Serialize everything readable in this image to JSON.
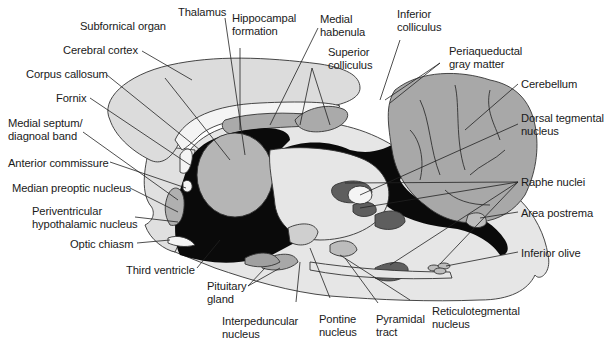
{
  "figure": {
    "colors": {
      "background": "#ffffff",
      "brain_light": "#e3e3e3",
      "cortex": "#dedede",
      "mid_gray": "#b0b0b0",
      "cerebellum": "#a6a6a6",
      "dark_nuclei": "#5e5e5e",
      "ventricle": "#0a0a0a",
      "white_matter": "#f4f4f4",
      "line": "#222222"
    },
    "labels": {
      "subfornical_organ": "Subfornical organ",
      "cerebral_cortex": "Cerebral cortex",
      "corpus_callosum": "Corpus callosum",
      "fornix": "Fornix",
      "medial_septum_1": "Medial septum/",
      "medial_septum_2": "diagnoal band",
      "anterior_commissure": "Anterior commissure",
      "median_preoptic": "Median preoptic nucleus",
      "periventricular_1": "Periventricular",
      "periventricular_2": "hypothalamic nucleus",
      "optic_chiasm": "Optic chiasm",
      "third_ventricle": "Third ventricle",
      "pituitary_1": "Pituitary",
      "pituitary_2": "gland",
      "interpeduncular_1": "Interpeduncular",
      "interpeduncular_2": "nucleus",
      "pontine_1": "Pontine",
      "pontine_2": "nucleus",
      "pyramidal_1": "Pyramidal",
      "pyramidal_2": "tract",
      "reticulotegmental_1": "Reticulotegmental",
      "reticulotegmental_2": "nucleus",
      "thalamus": "Thalamus",
      "hippocampal_1": "Hippocampal",
      "hippocampal_2": "formation",
      "medial_habenula_1": "Medial",
      "medial_habenula_2": "habenula",
      "superior_colliculus_1": "Superior",
      "superior_colliculus_2": "colliculus",
      "inferior_colliculus_1": "Inferior",
      "inferior_colliculus_2": "colliculus",
      "periaqueductal_1": "Periaqueductal",
      "periaqueductal_2": "gray matter",
      "cerebellum": "Cerebellum",
      "dorsal_tegmental_1": "Dorsal tegmental",
      "dorsal_tegmental_2": "nucleus",
      "raphe_nuclei": "Raphe nuclei",
      "area_postrema": "Area postrema",
      "inferior_olive": "Inferior olive"
    }
  }
}
